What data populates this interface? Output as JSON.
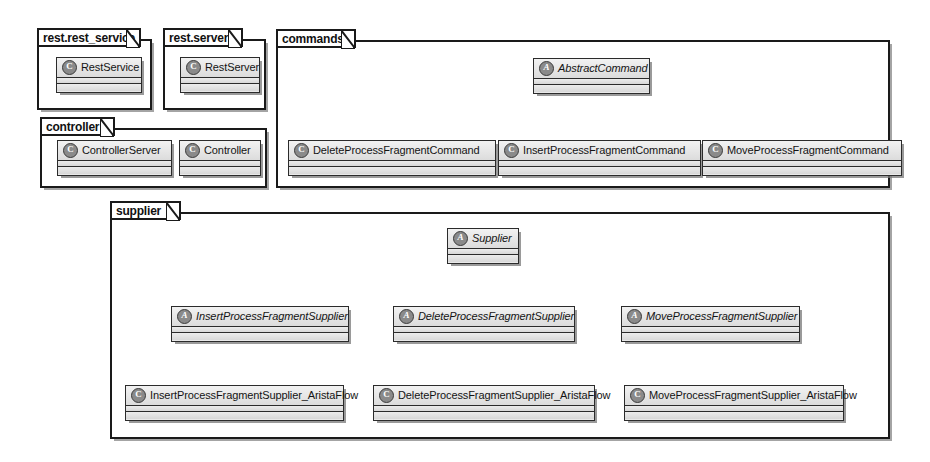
{
  "diagram": {
    "background_color": "#ffffff",
    "class_fill_color": "#e9e9e9",
    "line_color": "#1a1a1a"
  },
  "packages": [
    {
      "id": "rest_rest_service",
      "name": "rest.rest_service"
    },
    {
      "id": "rest_server",
      "name": "rest.server"
    },
    {
      "id": "controller",
      "name": "controller"
    },
    {
      "id": "commands",
      "name": "commands"
    },
    {
      "id": "supplier",
      "name": "supplier"
    }
  ],
  "classes": [
    {
      "id": "rest_service",
      "name": "RestService",
      "stereotype": "class",
      "badge": "C",
      "package": "rest.rest_service"
    },
    {
      "id": "rest_server",
      "name": "RestServer",
      "stereotype": "class",
      "badge": "C",
      "package": "rest.server"
    },
    {
      "id": "controller_server",
      "name": "ControllerServer",
      "stereotype": "class",
      "badge": "C",
      "package": "controller"
    },
    {
      "id": "controller_class",
      "name": "Controller",
      "stereotype": "class",
      "badge": "C",
      "package": "controller"
    },
    {
      "id": "abstract_command",
      "name": "AbstractCommand",
      "stereotype": "abstract",
      "badge": "A",
      "package": "commands"
    },
    {
      "id": "delete_command",
      "name": "DeleteProcessFragmentCommand",
      "stereotype": "class",
      "badge": "C",
      "package": "commands"
    },
    {
      "id": "insert_command",
      "name": "InsertProcessFragmentCommand",
      "stereotype": "class",
      "badge": "C",
      "package": "commands"
    },
    {
      "id": "move_command",
      "name": "MoveProcessFragmentCommand",
      "stereotype": "class",
      "badge": "C",
      "package": "commands"
    },
    {
      "id": "supplier_base",
      "name": "Supplier",
      "stereotype": "abstract",
      "badge": "A",
      "package": "supplier"
    },
    {
      "id": "insert_supplier",
      "name": "InsertProcessFragmentSupplier",
      "stereotype": "abstract",
      "badge": "A",
      "package": "supplier"
    },
    {
      "id": "delete_supplier",
      "name": "DeleteProcessFragmentSupplier",
      "stereotype": "abstract",
      "badge": "A",
      "package": "supplier"
    },
    {
      "id": "move_supplier",
      "name": "MoveProcessFragmentSupplier",
      "stereotype": "abstract",
      "badge": "A",
      "package": "supplier"
    },
    {
      "id": "insert_supplier_af",
      "name": "InsertProcessFragmentSupplier_AristaFlow",
      "stereotype": "class",
      "badge": "C",
      "package": "supplier"
    },
    {
      "id": "delete_supplier_af",
      "name": "DeleteProcessFragmentSupplier_AristaFlow",
      "stereotype": "class",
      "badge": "C",
      "package": "supplier"
    },
    {
      "id": "move_supplier_af",
      "name": "MoveProcessFragmentSupplier_AristaFlow",
      "stereotype": "class",
      "badge": "C",
      "package": "supplier"
    }
  ],
  "generalizations": [
    {
      "from": "DeleteProcessFragmentCommand",
      "to": "AbstractCommand"
    },
    {
      "from": "InsertProcessFragmentCommand",
      "to": "AbstractCommand"
    },
    {
      "from": "MoveProcessFragmentCommand",
      "to": "AbstractCommand"
    },
    {
      "from": "InsertProcessFragmentSupplier",
      "to": "Supplier"
    },
    {
      "from": "DeleteProcessFragmentSupplier",
      "to": "Supplier"
    },
    {
      "from": "MoveProcessFragmentSupplier",
      "to": "Supplier"
    },
    {
      "from": "InsertProcessFragmentSupplier_AristaFlow",
      "to": "InsertProcessFragmentSupplier"
    },
    {
      "from": "DeleteProcessFragmentSupplier_AristaFlow",
      "to": "DeleteProcessFragmentSupplier"
    },
    {
      "from": "MoveProcessFragmentSupplier_AristaFlow",
      "to": "MoveProcessFragmentSupplier"
    }
  ]
}
